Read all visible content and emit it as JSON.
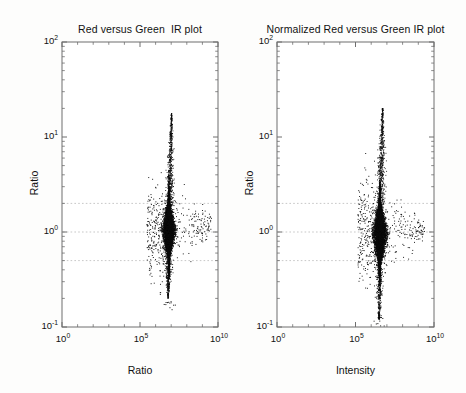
{
  "figure": {
    "width": 466,
    "height": 393,
    "background": "#fdfdfc",
    "point_color": "#0b0b0b",
    "axis_color": "#6f6f6f",
    "refline_color": "#b9b9b9"
  },
  "panels": [
    {
      "id": "left",
      "title": "Red versus Green  IR plot",
      "xlabel": "Ratio",
      "ylabel": "Ratio",
      "x_ticklabels": [
        "10",
        "10",
        "10"
      ],
      "x_tickexp": [
        "0",
        "5",
        "10"
      ],
      "y_ticklabels": [
        "10",
        "10",
        "10",
        "10"
      ],
      "y_tickexp": [
        "2",
        "1",
        "0",
        "-1"
      ],
      "frame": {
        "left": 62,
        "top": 42,
        "right": 218,
        "bottom": 327
      },
      "reference_lines": [
        2.0,
        1.0,
        0.5
      ]
    },
    {
      "id": "right",
      "title": "Normalized Red versus Green IR plot",
      "xlabel": "Intensity",
      "ylabel": "Ratio",
      "x_ticklabels": [
        "10",
        "10",
        "10"
      ],
      "x_tickexp": [
        "0",
        "5",
        "10"
      ],
      "y_ticklabels": [
        "10",
        "10",
        "10",
        "10"
      ],
      "y_tickexp": [
        "2",
        "1",
        "0",
        "-1"
      ],
      "frame": {
        "left": 277,
        "top": 42,
        "right": 434,
        "bottom": 327
      },
      "reference_lines": [
        2.0,
        1.0,
        0.5
      ]
    }
  ],
  "chart_data": [
    {
      "type": "scatter",
      "id": "left",
      "title": "Red versus Green  IR plot",
      "xlabel": "Ratio",
      "ylabel": "Ratio",
      "xscale": "log",
      "yscale": "log",
      "xlim": [
        1,
        10000000000.0
      ],
      "ylim": [
        0.1,
        100
      ],
      "xticks": [
        1,
        100000,
        10000000000
      ],
      "yticks": [
        0.1,
        1,
        10,
        100
      ],
      "grid": false,
      "legend": null,
      "annotations": [
        {
          "type": "hline",
          "y": 2.0,
          "style": "dotted",
          "color": "#b9b9b9"
        },
        {
          "type": "hline",
          "y": 1.0,
          "style": "dotted",
          "color": "#b9b9b9"
        },
        {
          "type": "hline",
          "y": 0.5,
          "style": "dotted",
          "color": "#b9b9b9"
        }
      ],
      "n_points": 6500,
      "cloud": {
        "shape": "teardrop",
        "x_center_log10": 6.85,
        "x_spread_log10": 0.62,
        "y_center_log10": 0.02,
        "y_spread_log10": 0.3,
        "upper_plume_top_log10": 1.25,
        "lower_tail_bottom_log10": -0.7,
        "right_tail_x_log10": 9.6,
        "outlier_min_y_log10": -0.85
      }
    },
    {
      "type": "scatter",
      "id": "right",
      "title": "Normalized Red versus Green IR plot",
      "xlabel": "Intensity",
      "ylabel": "Ratio",
      "xscale": "log",
      "yscale": "log",
      "xlim": [
        1,
        10000000000.0
      ],
      "ylim": [
        0.1,
        100
      ],
      "xticks": [
        1,
        100000,
        10000000000
      ],
      "yticks": [
        0.1,
        1,
        10,
        100
      ],
      "grid": false,
      "legend": null,
      "annotations": [
        {
          "type": "hline",
          "y": 2.0,
          "style": "dotted",
          "color": "#b9b9b9"
        },
        {
          "type": "hline",
          "y": 1.0,
          "style": "dotted",
          "color": "#b9b9b9"
        },
        {
          "type": "hline",
          "y": 0.5,
          "style": "dotted",
          "color": "#b9b9b9"
        }
      ],
      "n_points": 6500,
      "cloud": {
        "shape": "diamond",
        "x_center_log10": 6.55,
        "x_spread_log10": 0.7,
        "y_center_log10": -0.02,
        "y_spread_log10": 0.33,
        "upper_plume_top_log10": 1.3,
        "lower_tail_bottom_log10": -0.92,
        "right_tail_x_log10": 9.4,
        "outlier_min_y_log10": -1.0
      }
    }
  ]
}
